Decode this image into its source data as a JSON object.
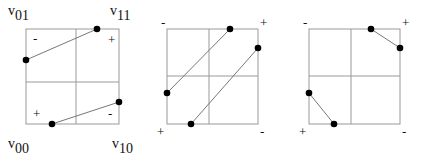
{
  "diagram": {
    "panels": [
      {
        "id": "panel-1",
        "box": {
          "x": 26,
          "y": 29,
          "w": 93,
          "h": 95
        },
        "midlines": {
          "x": 76,
          "y": 82
        },
        "corner_signs": {
          "top_left": "-",
          "top_right": "+",
          "bottom_left": "+",
          "bottom_right": "-"
        },
        "corner_sign_placement": "inside",
        "vertex_labels": {
          "top_left": {
            "base": "v",
            "sub": "01"
          },
          "top_right": {
            "base": "v",
            "sub": "11"
          },
          "bottom_left": {
            "base": "v",
            "sub": "00"
          },
          "bottom_right": {
            "base": "v",
            "sub": "10"
          }
        },
        "segments": [
          {
            "x1": 26,
            "y1": 60,
            "x2": 97,
            "y2": 29
          },
          {
            "x1": 52,
            "y1": 124,
            "x2": 119,
            "y2": 102
          }
        ]
      },
      {
        "id": "panel-2",
        "box": {
          "x": 167,
          "y": 29,
          "w": 91,
          "h": 95
        },
        "midlines": {
          "x": 209,
          "y": 76
        },
        "corner_signs": {
          "top_left": "-",
          "top_right": "+",
          "bottom_left": "+",
          "bottom_right": "-"
        },
        "corner_sign_placement": "outside",
        "segments": [
          {
            "x1": 167,
            "y1": 93,
            "x2": 230,
            "y2": 29
          },
          {
            "x1": 191,
            "y1": 124,
            "x2": 258,
            "y2": 48
          }
        ]
      },
      {
        "id": "panel-3",
        "box": {
          "x": 309,
          "y": 29,
          "w": 91,
          "h": 95
        },
        "midlines": {
          "x": 351,
          "y": 76
        },
        "corner_signs": {
          "top_left": "-",
          "top_right": "+",
          "bottom_left": "+",
          "bottom_right": "-"
        },
        "corner_sign_placement": "outside",
        "segments": [
          {
            "x1": 371,
            "y1": 29,
            "x2": 400,
            "y2": 48
          },
          {
            "x1": 309,
            "y1": 93,
            "x2": 334,
            "y2": 124
          }
        ]
      }
    ],
    "colors": {
      "box": "#999999",
      "segment": "#777777",
      "point": "#000000",
      "text": "#111111"
    }
  }
}
